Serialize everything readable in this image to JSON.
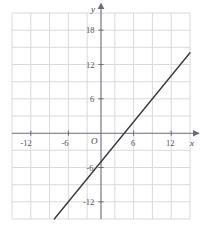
{
  "chart_data": {
    "type": "line",
    "title": "",
    "xlabel": "x",
    "ylabel": "y",
    "xlim": [
      -15,
      15
    ],
    "ylim": [
      -15,
      21
    ],
    "grid": true,
    "grid_step": 3,
    "legend": "none",
    "origin_label": "O",
    "x_tick_labels": [
      "-12",
      "-6",
      "6",
      "12"
    ],
    "x_tick_values": [
      -12,
      -6,
      6,
      12
    ],
    "y_tick_labels": [
      "18",
      "12",
      "6",
      "-6",
      "-12"
    ],
    "y_tick_values": [
      18,
      12,
      6,
      -6,
      -12
    ],
    "series": [
      {
        "name": "line",
        "slope": 1.27,
        "y_intercept": -5,
        "x_intercept": 3.9,
        "points": [
          [
            -14.2,
            -23.0
          ],
          [
            15.0,
            14.1
          ]
        ],
        "color": "#3a3a3a"
      }
    ]
  },
  "axes": {
    "x_axis_name": "x",
    "y_axis_name": "y",
    "origin": "O"
  },
  "ticks": {
    "x_neg_12": "-12",
    "x_neg_6": "-6",
    "x_pos_6": "6",
    "x_pos_12": "12",
    "y_pos_18": "18",
    "y_pos_12": "12",
    "y_pos_6": "6",
    "y_neg_6": "-6",
    "y_neg_12": "-12"
  },
  "colors": {
    "grid": "#d9d9e0",
    "axis": "#6b6b78",
    "line": "#3a3a3a",
    "text": "#555555"
  }
}
